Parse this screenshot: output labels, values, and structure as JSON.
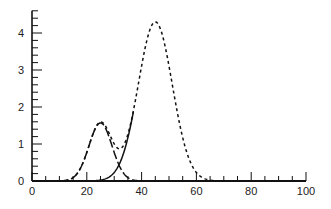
{
  "chart_data": {
    "type": "line",
    "title": "",
    "xlabel": "",
    "ylabel": "",
    "xlim": [
      0,
      100
    ],
    "ylim": [
      0,
      4.6
    ],
    "x_ticks": [
      0,
      20,
      40,
      60,
      80,
      100
    ],
    "y_ticks": [
      0,
      1,
      2,
      3,
      4
    ],
    "x_minor_step": 5,
    "y_minor_step": 0.2,
    "grid": false,
    "legend": null,
    "series": [
      {
        "name": "component-1",
        "style": "long-dash",
        "shape": "gaussian",
        "amplitude": 1.57,
        "center": 25,
        "sigma": 4.2,
        "x_range": [
          10,
          40
        ]
      },
      {
        "name": "component-2",
        "style": "solid",
        "shape": "gaussian",
        "amplitude": 4.3,
        "center": 45,
        "sigma": 6.2,
        "x_range": [
          18,
          37
        ]
      },
      {
        "name": "sum",
        "style": "dotted",
        "shape": "sum-of-components",
        "x_range": [
          10,
          70
        ],
        "peak": {
          "x": 45,
          "y": 4.3
        },
        "local_max": {
          "x": 25,
          "y": 1.7
        },
        "local_min": {
          "x": 30,
          "y": 1.5
        }
      }
    ]
  }
}
